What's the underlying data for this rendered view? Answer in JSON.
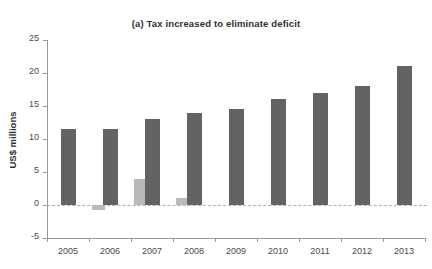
{
  "chart_data": {
    "type": "bar",
    "title": "(a) Tax increased to eliminate deficit",
    "xlabel": "",
    "ylabel": "US$ millions",
    "categories": [
      "2005",
      "2006",
      "2007",
      "2008",
      "2009",
      "2010",
      "2011",
      "2012",
      "2013"
    ],
    "series": [
      {
        "name": "primary",
        "color": "#636363",
        "values": [
          11.5,
          11.5,
          13.0,
          14.0,
          14.5,
          16.0,
          17.0,
          18.0,
          21.0
        ]
      },
      {
        "name": "secondary",
        "color": "#b9b9b9",
        "values": [
          0,
          -0.7,
          4.0,
          1.0,
          0,
          0,
          0,
          0,
          0
        ]
      }
    ],
    "ylim": [
      -5,
      25
    ],
    "yticks": [
      "25",
      "20",
      "15",
      "10",
      "5",
      "0",
      "-5"
    ],
    "ytick_values": [
      25,
      20,
      15,
      10,
      5,
      0,
      -5
    ],
    "grid": false,
    "legend": "none",
    "zero_line": true
  },
  "colors": {
    "primary_bar": "#636363",
    "secondary_bar": "#b9b9b9",
    "axis": "#9a9a9a",
    "zero_line": "#b0b0b0",
    "text": "#3a3a3a",
    "background": "#ffffff"
  }
}
